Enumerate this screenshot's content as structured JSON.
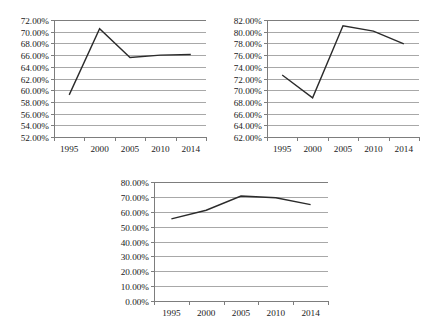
{
  "chart_data": [
    {
      "id": "chart-1",
      "type": "line",
      "title": "",
      "subtitle": "",
      "xlabel": "",
      "ylabel": "",
      "grid": true,
      "legend": "none",
      "categories": [
        "1995",
        "2000",
        "2005",
        "2010",
        "2014"
      ],
      "x_tick_labels": [
        "1995",
        "2000",
        "2005",
        "2010",
        "2014"
      ],
      "y_tick_labels": [
        "52.00%",
        "54.00%",
        "56.00%",
        "58.00%",
        "60.00%",
        "62.00%",
        "64.00%",
        "66.00%",
        "68.00%",
        "70.00%",
        "72.00%"
      ],
      "ylim": [
        52,
        72
      ],
      "y_tick_step": 2,
      "values": [
        59.2,
        70.5,
        65.6,
        66.0,
        66.1
      ],
      "series": [
        {
          "name": "series-1",
          "values": [
            59.2,
            70.5,
            65.6,
            66.0,
            66.1
          ]
        }
      ]
    },
    {
      "id": "chart-2",
      "type": "line",
      "title": "",
      "subtitle": "",
      "xlabel": "",
      "ylabel": "",
      "grid": true,
      "legend": "none",
      "categories": [
        "1995",
        "2000",
        "2005",
        "2010",
        "2014"
      ],
      "x_tick_labels": [
        "1995",
        "2000",
        "2005",
        "2010",
        "2014"
      ],
      "y_tick_labels": [
        "62.00%",
        "64.00%",
        "66.00%",
        "68.00%",
        "70.00%",
        "72.00%",
        "74.00%",
        "76.00%",
        "78.00%",
        "80.00%",
        "82.00%"
      ],
      "ylim": [
        62,
        82
      ],
      "y_tick_step": 2,
      "values": [
        72.6,
        68.7,
        81.0,
        80.1,
        77.9
      ],
      "series": [
        {
          "name": "series-1",
          "values": [
            72.6,
            68.7,
            81.0,
            80.1,
            77.9
          ]
        }
      ]
    },
    {
      "id": "chart-3",
      "type": "line",
      "title": "",
      "subtitle": "",
      "xlabel": "",
      "ylabel": "",
      "grid": true,
      "legend": "none",
      "categories": [
        "1995",
        "2000",
        "2005",
        "2010",
        "2014"
      ],
      "x_tick_labels": [
        "1995",
        "2000",
        "2005",
        "2010",
        "2014"
      ],
      "y_tick_labels": [
        "0.00%",
        "10.00%",
        "20.00%",
        "30.00%",
        "40.00%",
        "50.00%",
        "60.00%",
        "70.00%",
        "80.00%"
      ],
      "ylim": [
        0,
        80
      ],
      "y_tick_step": 10,
      "values": [
        55.2,
        61.0,
        70.6,
        69.4,
        64.8
      ],
      "series": [
        {
          "name": "series-1",
          "values": [
            55.2,
            61.0,
            70.6,
            69.4,
            64.8
          ]
        }
      ]
    }
  ],
  "colors": {
    "line": "#2b2b2b",
    "gridline": "#a8a8a8",
    "axis": "#7d7d7d",
    "text": "#1a1a1a",
    "background": "#ffffff"
  }
}
